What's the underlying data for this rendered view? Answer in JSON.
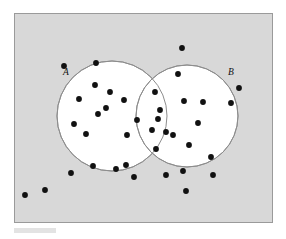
{
  "figure": {
    "name": "venn-diagram-two-sets",
    "type": "venn",
    "title": "",
    "frame": {
      "x": 14,
      "y": 13,
      "width": 258,
      "height": 209,
      "fill": "#d8d8d8",
      "stroke": "#9a9a9a",
      "stroke_width": 1
    },
    "background": "#ffffff",
    "caption_bar": {
      "visible": true,
      "color": "#e3e3e3"
    }
  },
  "chart_data": {
    "type": "venn",
    "title": "",
    "xlabel": "",
    "ylabel": "",
    "sets": [
      {
        "id": "A",
        "label": "A",
        "label_x": 66,
        "label_y": 75,
        "cx": 112,
        "cy": 116,
        "r": 55,
        "fill": "#ffffff",
        "stroke": "#8d8d8d"
      },
      {
        "id": "B",
        "label": "B",
        "label_x": 231,
        "label_y": 75,
        "cx": 187,
        "cy": 116,
        "r": 51,
        "fill": "#ffffff",
        "stroke": "#8d8d8d"
      }
    ],
    "dot_style": {
      "radius": 2.9,
      "color": "#111111"
    },
    "counts": {
      "only_a": 12,
      "only_b": 11,
      "intersection": 5,
      "outside": 11,
      "total": 39
    },
    "points": [
      {
        "x": 64,
        "y": 66,
        "region": "outside"
      },
      {
        "x": 96,
        "y": 63,
        "region": "outside"
      },
      {
        "x": 182,
        "y": 48,
        "region": "outside"
      },
      {
        "x": 239,
        "y": 88,
        "region": "outside"
      },
      {
        "x": 45,
        "y": 190,
        "region": "outside"
      },
      {
        "x": 71,
        "y": 173,
        "region": "outside"
      },
      {
        "x": 134,
        "y": 177,
        "region": "outside"
      },
      {
        "x": 186,
        "y": 191,
        "region": "outside"
      },
      {
        "x": 213,
        "y": 175,
        "region": "outside"
      },
      {
        "x": 25,
        "y": 195,
        "region": "outside"
      },
      {
        "x": 166,
        "y": 175,
        "region": "outside"
      },
      {
        "x": 95,
        "y": 85,
        "region": "only_a"
      },
      {
        "x": 110,
        "y": 92,
        "region": "only_a"
      },
      {
        "x": 79,
        "y": 99,
        "region": "only_a"
      },
      {
        "x": 124,
        "y": 100,
        "region": "only_a"
      },
      {
        "x": 98,
        "y": 114,
        "region": "only_a"
      },
      {
        "x": 74,
        "y": 124,
        "region": "only_a"
      },
      {
        "x": 86,
        "y": 134,
        "region": "only_a"
      },
      {
        "x": 127,
        "y": 135,
        "region": "only_a"
      },
      {
        "x": 93,
        "y": 166,
        "region": "only_a"
      },
      {
        "x": 126,
        "y": 165,
        "region": "only_a"
      },
      {
        "x": 116,
        "y": 169,
        "region": "only_a"
      },
      {
        "x": 106,
        "y": 108,
        "region": "only_a"
      },
      {
        "x": 178,
        "y": 74,
        "region": "only_b"
      },
      {
        "x": 184,
        "y": 101,
        "region": "only_b"
      },
      {
        "x": 203,
        "y": 102,
        "region": "only_b"
      },
      {
        "x": 231,
        "y": 103,
        "region": "only_b"
      },
      {
        "x": 173,
        "y": 135,
        "region": "only_b"
      },
      {
        "x": 189,
        "y": 145,
        "region": "only_b"
      },
      {
        "x": 211,
        "y": 157,
        "region": "only_b"
      },
      {
        "x": 183,
        "y": 171,
        "region": "only_b"
      },
      {
        "x": 166,
        "y": 132,
        "region": "only_b"
      },
      {
        "x": 160,
        "y": 110,
        "region": "only_b"
      },
      {
        "x": 198,
        "y": 123,
        "region": "only_b"
      },
      {
        "x": 155,
        "y": 92,
        "region": "intersection"
      },
      {
        "x": 137,
        "y": 120,
        "region": "intersection"
      },
      {
        "x": 158,
        "y": 119,
        "region": "intersection"
      },
      {
        "x": 152,
        "y": 130,
        "region": "intersection"
      },
      {
        "x": 156,
        "y": 149,
        "region": "intersection"
      }
    ],
    "grid": false,
    "legend": "none"
  }
}
